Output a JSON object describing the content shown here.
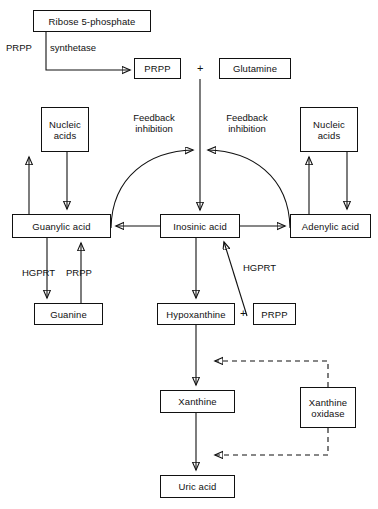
{
  "diagram": {
    "stroke_color": "#111111",
    "background_color": "#ffffff",
    "nodes": {
      "ribose5p": "Ribose 5-phosphate",
      "prpp_top": "PRPP",
      "glutamine": "Glutamine",
      "nucleic_acids_left": "Nucleic\nacids",
      "nucleic_acids_right": "Nucleic\nacids",
      "guanylic_acid": "Guanylic acid",
      "inosinic_acid": "Inosinic acid",
      "adenylic_acid": "Adenylic acid",
      "guanine": "Guanine",
      "hypoxanthine": "Hypoxanthine",
      "prpp_mid": "PRPP",
      "xanthine": "Xanthine",
      "xanthine_oxidase": "Xanthine\noxidase",
      "uric_acid": "Uric acid"
    },
    "labels": {
      "prpp_enzyme": "PRPP",
      "synthetase": "synthetase",
      "feedback_left": "Feedback\ninhibition",
      "feedback_right": "Feedback\ninhibition",
      "hgprt_left": "HGPRT",
      "prpp_left": "PRPP",
      "hgprt_right": "HGPRT",
      "plus_top": "+",
      "plus_mid": "+"
    }
  }
}
